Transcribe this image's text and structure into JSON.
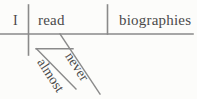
{
  "diagram": {
    "type": "reed-kellogg-sentence-diagram",
    "sentence": "I almost never read biographies",
    "colors": {
      "line": "#8a8a8a",
      "text": "#4a4a4a",
      "background": "#fcfcfa"
    },
    "baseline": {
      "label": "baseline",
      "x1": 0,
      "y1": 34,
      "x2": 193,
      "y2": 34
    },
    "dividers": [
      {
        "name": "subject-verb-divider",
        "x": 28,
        "y1": 5,
        "y2": 55
      },
      {
        "name": "verb-object-divider",
        "x": 107,
        "y1": 5,
        "y2": 34
      }
    ],
    "words": {
      "subject": "I",
      "verb": "read",
      "object": "biographies",
      "adverb_primary": "never",
      "adverb_secondary": "almost"
    },
    "modifier_lines": [
      {
        "name": "never-slant-line",
        "x1": 60,
        "y1": 34,
        "x2": 100,
        "y2": 94
      },
      {
        "name": "almost-slant-line",
        "x1": 37,
        "y1": 49,
        "x2": 76,
        "y2": 89
      },
      {
        "name": "almost-horizontal-connector",
        "x1": 36,
        "y1": 49,
        "x2": 73,
        "y2": 49
      }
    ]
  }
}
